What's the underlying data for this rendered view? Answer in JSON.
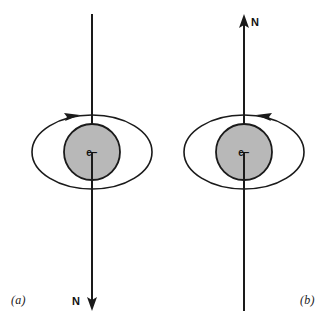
{
  "figure": {
    "background_color": "#ffffff",
    "stroke_color": "#1a1a1a",
    "sphere_fill_color": "#b8b8b8",
    "panels": [
      {
        "caption": "(a)",
        "pole_label": "N",
        "particle_label": "e−",
        "axis_arrow_direction": "down",
        "orbit_arrow_direction": "right",
        "axis_x": 92,
        "axis_top_y": 14,
        "axis_bottom_y": 311,
        "sphere_center_x": 92,
        "sphere_center_y": 152,
        "sphere_radius": 28,
        "orbit_rx": 60,
        "orbit_ry": 37
      },
      {
        "caption": "(b)",
        "pole_label": "N",
        "particle_label": "e−",
        "axis_arrow_direction": "up",
        "orbit_arrow_direction": "left",
        "axis_x": 244,
        "axis_top_y": 14,
        "axis_bottom_y": 311,
        "sphere_center_x": 244,
        "sphere_center_y": 152,
        "sphere_radius": 28,
        "orbit_rx": 60,
        "orbit_ry": 37
      }
    ]
  }
}
